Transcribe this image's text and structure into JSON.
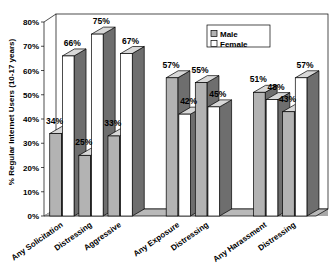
{
  "chart_data": {
    "type": "bar",
    "title": "",
    "xlabel": "",
    "ylabel": "% Regular Internet Users (10-17 years)",
    "ylim": [
      0,
      80
    ],
    "yticks": [
      "0%",
      "10%",
      "20%",
      "30%",
      "40%",
      "50%",
      "60%",
      "70%",
      "80%"
    ],
    "ytick_values": [
      0,
      10,
      20,
      30,
      40,
      50,
      60,
      70,
      80
    ],
    "grid": false,
    "legend_position": "top-right",
    "categories": [
      "Any Solicitation",
      "Distressing",
      "Aggressive",
      "Any Exposure",
      "Distressing",
      "Any Harassment",
      "Distressing"
    ],
    "group_breaks": [
      3,
      5
    ],
    "series": [
      {
        "name": "Male",
        "color": "#b3b3b3",
        "side_color": "#6e6e6e",
        "values": [
          34,
          25,
          33,
          57,
          55,
          51,
          43
        ],
        "labels": [
          "34%",
          "25%",
          "33%",
          "57%",
          "55%",
          "51%",
          "43%"
        ]
      },
      {
        "name": "Female",
        "color": "#ffffff",
        "side_color": "#6e6e6e",
        "values": [
          66,
          75,
          67,
          42,
          45,
          48,
          57
        ],
        "labels": [
          "66%",
          "75%",
          "67%",
          "42%",
          "45%",
          "48%",
          "57%"
        ]
      }
    ]
  },
  "legend": {
    "items": [
      {
        "label": "Male",
        "swatch": "#b3b3b3"
      },
      {
        "label": "Female",
        "swatch": "#ffffff"
      }
    ]
  },
  "axis": {
    "y_title": "% Regular Internet Users (10-17 years)",
    "y_ticks": [
      {
        "label": "80%"
      },
      {
        "label": "70%"
      },
      {
        "label": "60%"
      },
      {
        "label": "50%"
      },
      {
        "label": "40%"
      },
      {
        "label": "30%"
      },
      {
        "label": "20%"
      },
      {
        "label": "10%"
      },
      {
        "label": "0%"
      }
    ]
  },
  "colors": {
    "bar_male": "#b3b3b3",
    "bar_female": "#ffffff",
    "bar_side": "#6e6e6e",
    "bar_outline": "#000000",
    "floor": "#b0b0b0",
    "floor_top": "#cfcfcf",
    "frame": "#000000",
    "background": "#ffffff"
  }
}
